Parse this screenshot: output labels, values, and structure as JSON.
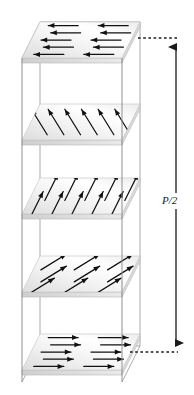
{
  "figure": {
    "type": "diagram",
    "background_color": "#ffffff",
    "box": {
      "name": "transparent-box",
      "edge_color": "#8f8f8f",
      "front_left_x": 22,
      "front_right_x": 122,
      "back_left_x": 40,
      "back_right_x": 140,
      "top_front_y": 58,
      "bottom_front_y": 382,
      "depth_rise": 36
    },
    "plates": [
      {
        "id": "layer-5-top",
        "label": "top layer",
        "angle_deg": 180,
        "angle_text": "180°",
        "front_y": 58,
        "fill_light": "#ffffff",
        "fill_dark": "#e2e2e2",
        "arrow_rows": 5,
        "arrow_cols": 2,
        "arrow_color": "#111111"
      },
      {
        "id": "layer-4",
        "label": "second layer",
        "angle_deg": 135,
        "angle_text": "135°",
        "front_y": 140,
        "fill_light": "#ffffff",
        "fill_dark": "#e2e2e2",
        "arrow_rows": 1,
        "arrow_cols": 6,
        "arrow_color": "#111111"
      },
      {
        "id": "layer-3-middle",
        "label": "middle layer",
        "angle_deg": 90,
        "angle_text": "90°",
        "front_y": 214,
        "fill_light": "#ffffff",
        "fill_dark": "#e2e2e2",
        "arrow_rows": 2,
        "arrow_cols": 5,
        "arrow_color": "#111111"
      },
      {
        "id": "layer-2",
        "label": "fourth layer",
        "angle_deg": 45,
        "angle_text": "45°",
        "front_y": 292,
        "fill_light": "#ffffff",
        "fill_dark": "#e2e2e2",
        "arrow_rows": 3,
        "arrow_cols": 3,
        "arrow_color": "#111111"
      },
      {
        "id": "layer-1-bottom",
        "label": "bottom layer",
        "angle_deg": 0,
        "angle_text": "0°",
        "front_y": 370,
        "fill_light": "#ffffff",
        "fill_dark": "#e2e2e2",
        "arrow_rows": 5,
        "arrow_cols": 2,
        "arrow_color": "#111111"
      }
    ],
    "dimension": {
      "name": "pitch-dimension",
      "label": "P/2",
      "line_color": "#1a1a1a",
      "leader_style": "dotted",
      "x": 176,
      "top_y": 38,
      "bottom_y": 352,
      "label_x": 172,
      "label_y": 201,
      "leader_top_from_x": 138,
      "leader_bottom_from_x": 130
    }
  }
}
